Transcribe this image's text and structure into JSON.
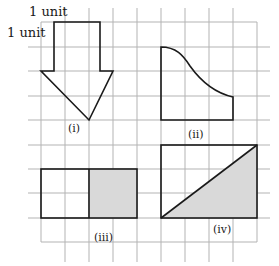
{
  "diagram": {
    "title": "",
    "unit_labels": {
      "horizontal": "1 unit",
      "vertical": "1 unit"
    },
    "grid": {
      "columns": 9,
      "rows": 9,
      "origin_x": 41,
      "origin_y": 22,
      "cell_w": 24,
      "cell_h": 24.4,
      "line_color": "#b3b3b3"
    },
    "colors": {
      "outline": "#1a1a1a",
      "shade": "#d9d9d9",
      "background": "#ffffff"
    },
    "figures": [
      {
        "id": "i",
        "label": "(i)",
        "description": "Downward arrow: 2-unit-wide stem 2 units tall on a 3-unit-wide, 2-unit-tall triangular head"
      },
      {
        "id": "ii",
        "label": "(ii)",
        "description": "Shape with left edge 3 units, base 3 units, right edge 1 unit, and a curved top edge"
      },
      {
        "id": "iii",
        "label": "(iii)",
        "description": "4 by 2 rectangle with right half shaded"
      },
      {
        "id": "iv",
        "label": "(iv)",
        "description": "4 by 3 rectangle divided by a diagonal, lower-right triangle shaded"
      }
    ]
  }
}
